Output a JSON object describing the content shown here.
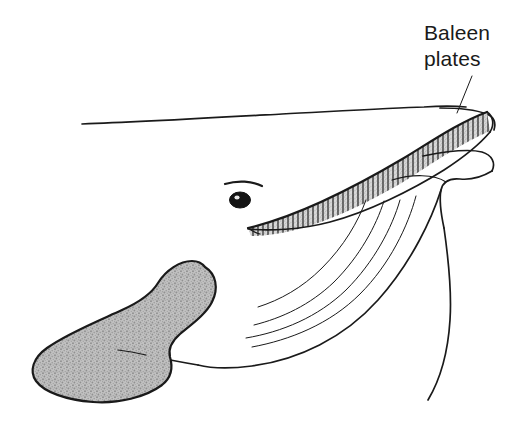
{
  "figure": {
    "background_color": "#ffffff",
    "ink_color": "#1a1a1a",
    "flipper_fill_color": "#b9b9b9",
    "baleen_fringe_color": "#c9c9c9"
  },
  "annotations": [
    {
      "id": "baleen-plates",
      "line1": "Baleen",
      "line2": "plates",
      "text_x": 424,
      "text_y_line1": 40,
      "text_y_line2": 66,
      "leader_from_x": 472,
      "leader_from_y": 76,
      "leader_to_x": 457,
      "leader_to_y": 113
    }
  ],
  "parts": {
    "eye": {
      "name": "eye",
      "cx": 240,
      "cy": 200,
      "rx": 10,
      "ry": 7.5
    },
    "brow": {
      "name": "brow-line"
    },
    "baleen": {
      "name": "baleen-plate-band",
      "plate_count": 46
    },
    "flipper": {
      "name": "pectoral-flipper"
    },
    "throat_grooves": {
      "name": "throat-groove-lines",
      "count": 4
    },
    "back": {
      "name": "dorsal-back-line"
    },
    "chin": {
      "name": "lower-jaw-chin-outline"
    },
    "body_edge": {
      "name": "body-right-edge"
    }
  }
}
